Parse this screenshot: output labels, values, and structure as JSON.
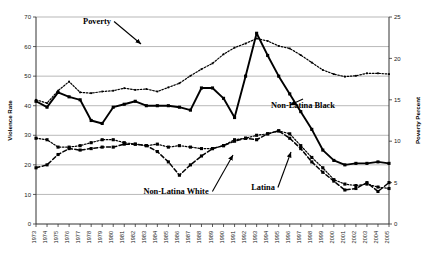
{
  "chart_data": {
    "type": "line",
    "title": "",
    "xlabel": "",
    "ylabel": "Violence Rate",
    "y2label": "Poverty Percent",
    "ylim": [
      0,
      70
    ],
    "y2lim": [
      0,
      25
    ],
    "yticks": [
      "0",
      "10",
      "20",
      "30",
      "40",
      "50",
      "60",
      "70"
    ],
    "y2ticks": [
      "0",
      "5",
      "10",
      "15",
      "20",
      "25"
    ],
    "grid": true,
    "legend_position": "inline-annotations",
    "categories": [
      "1973",
      "1974",
      "1975",
      "1976",
      "1977",
      "1978",
      "1979",
      "1980",
      "1981",
      "1982",
      "1983",
      "1984",
      "1985",
      "1986",
      "1987",
      "1988",
      "1989",
      "1990",
      "1991",
      "1992",
      "1993",
      "1994",
      "1995",
      "1996",
      "1997",
      "1998",
      "1999",
      "2000",
      "2001",
      "2002",
      "2003",
      "2004",
      "2005"
    ],
    "series": [
      {
        "name": "Poverty",
        "axis": "right",
        "style": "dotted",
        "values": [
          15.0,
          14.6,
          16.1,
          17.2,
          15.9,
          15.8,
          16.0,
          16.1,
          16.4,
          16.2,
          16.3,
          16.0,
          16.5,
          17.0,
          17.9,
          18.7,
          19.4,
          20.5,
          21.3,
          21.8,
          22.4,
          22.1,
          21.5,
          21.2,
          20.4,
          19.5,
          18.6,
          18.1,
          17.8,
          17.9,
          18.2,
          18.2,
          18.1
        ]
      },
      {
        "name": "Non-Latina Black",
        "axis": "left",
        "style": "solid",
        "values": [
          41.5,
          39.5,
          44.5,
          43.0,
          42.0,
          35.0,
          34.0,
          39.5,
          40.5,
          41.5,
          40.0,
          40.0,
          40.0,
          39.5,
          38.5,
          46.0,
          46.0,
          42.5,
          36.0,
          50.0,
          64.5,
          57.0,
          50.0,
          44.0,
          38.0,
          32.0,
          25.0,
          21.5,
          20.0,
          20.5,
          20.5,
          21.0,
          20.5
        ]
      },
      {
        "name": "Non-Latina White",
        "axis": "left",
        "style": "dotted",
        "values": [
          29.0,
          28.5,
          26.0,
          26.0,
          26.5,
          27.5,
          28.5,
          28.5,
          27.5,
          27.0,
          26.5,
          27.0,
          26.0,
          26.5,
          26.0,
          25.5,
          25.5,
          26.5,
          28.5,
          29.0,
          30.0,
          30.5,
          31.5,
          30.5,
          26.5,
          22.5,
          19.0,
          15.0,
          13.5,
          13.0,
          13.5,
          12.5,
          12.0
        ]
      },
      {
        "name": "Latina",
        "axis": "left",
        "style": "dashed",
        "values": [
          19.0,
          20.0,
          23.5,
          25.5,
          25.0,
          25.5,
          26.0,
          26.0,
          27.0,
          27.0,
          26.5,
          24.5,
          21.0,
          16.5,
          20.0,
          23.0,
          25.5,
          26.5,
          28.0,
          29.0,
          28.5,
          30.5,
          31.5,
          29.0,
          25.5,
          21.0,
          17.5,
          14.5,
          11.5,
          12.0,
          14.0,
          11.0,
          14.0
        ]
      }
    ],
    "annotations": [
      {
        "label": "Poverty",
        "x": 97,
        "y": 24,
        "arrow_to": [
          141,
          44
        ]
      },
      {
        "label": "Non-Latina Black",
        "x": 303,
        "y": 108,
        "arrow_to": [
          290,
          105
        ]
      },
      {
        "label": "Non-Latina White",
        "x": 176,
        "y": 194,
        "arrow_to": [
          233,
          155
        ]
      },
      {
        "label": "Latina",
        "x": 263,
        "y": 190,
        "arrow_to": [
          291,
          152
        ]
      }
    ]
  }
}
